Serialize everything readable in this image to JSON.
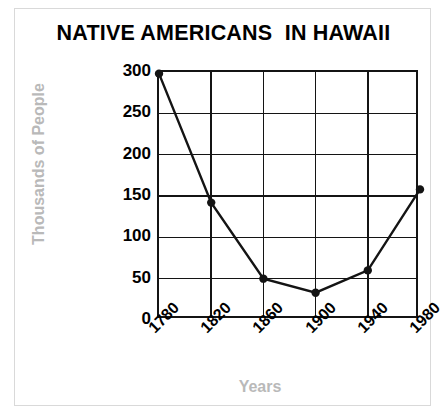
{
  "chart_data": {
    "type": "line",
    "title": "NATIVE AMERICANS  IN HAWAII",
    "xlabel": "Years",
    "ylabel": "Thousands of People",
    "x": [
      1780,
      1820,
      1860,
      1900,
      1940,
      1980
    ],
    "categories": [
      "1780",
      "1820",
      "1860",
      "1900",
      "1940",
      "1980"
    ],
    "values": [
      298,
      142,
      50,
      33,
      60,
      158
    ],
    "series": [
      {
        "name": "Native Americans in Hawaii",
        "values": [
          298,
          142,
          50,
          33,
          60,
          158
        ]
      }
    ],
    "ylim": [
      0,
      300
    ],
    "yticks": [
      300,
      250,
      200,
      150,
      100,
      50,
      0
    ],
    "ytick_labels": [
      "300",
      "250",
      "200",
      "150",
      "100",
      "50",
      "0"
    ],
    "xtick_labels": [
      "1780",
      "1820",
      "1860",
      "1900",
      "1940",
      "1980"
    ],
    "grid": true,
    "legend": null,
    "marker": "filled-circle",
    "line_color": "#141414",
    "marker_color": "#141414",
    "axis_label_color": "#b9b9b9",
    "title_color": "#000000",
    "background": "#ffffff"
  }
}
